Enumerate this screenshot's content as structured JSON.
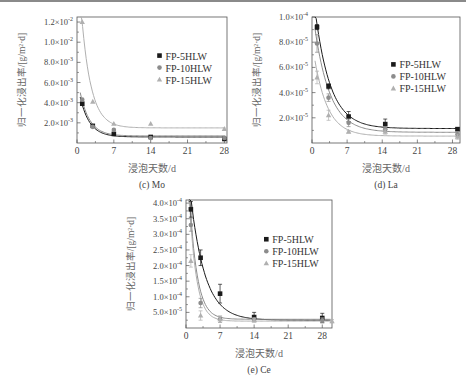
{
  "chart_data": [
    {
      "id": "mo",
      "type": "scatter",
      "caption": "(c) Mo",
      "title": "",
      "xlabel": "浸泡天数/d",
      "ylabel": "归一化浸出率/[g/m²·d]",
      "xlim": [
        0,
        28.5
      ],
      "ylim": [
        0,
        0.0125
      ],
      "xticks": [
        0,
        7,
        14,
        21,
        28
      ],
      "yticks": [
        0.002,
        0.004,
        0.006,
        0.008,
        0.01,
        0.012
      ],
      "ytick_labels": [
        {
          "m": "2.0",
          "e": "-3"
        },
        {
          "m": "4.0",
          "e": "-3"
        },
        {
          "m": "6.0",
          "e": "-3"
        },
        {
          "m": "8.0",
          "e": "-3"
        },
        {
          "m": "1.0",
          "e": "-2"
        },
        {
          "m": "1.2",
          "e": "-2"
        }
      ],
      "grid": false,
      "legend_position": "upper right (inside)",
      "series": [
        {
          "name": "FP-5HLW",
          "marker": "square",
          "color": "#1a1a1a",
          "x": [
            1,
            3,
            7,
            14,
            28
          ],
          "y": [
            0.0039,
            0.0017,
            0.0009,
            0.0006,
            0.0004
          ],
          "fit": {
            "a": 0.0055,
            "k": 0.55,
            "c": 0.0006
          }
        },
        {
          "name": "FP-10HLW",
          "marker": "circle",
          "color": "#8c8c8c",
          "x": [
            1,
            3,
            7,
            14,
            28
          ],
          "y": [
            0.0043,
            0.0016,
            0.0013,
            0.0005,
            0.0005
          ],
          "fit": {
            "a": 0.006,
            "k": 0.55,
            "c": 0.0007
          }
        },
        {
          "name": "FP-15HLW",
          "marker": "triangle",
          "color": "#b0b0b0",
          "x": [
            1,
            3,
            7,
            14,
            28
          ],
          "y": [
            0.012,
            0.0041,
            0.0019,
            0.0019,
            0.0014
          ],
          "fit": {
            "a": 0.018,
            "k": 0.55,
            "c": 0.0015
          }
        }
      ]
    },
    {
      "id": "la",
      "type": "scatter",
      "caption": "(d) La",
      "title": "",
      "xlabel": "浸泡天数/d",
      "ylabel": "归一化浸出率/[g/m²·d]",
      "xlim": [
        0,
        29.5
      ],
      "ylim": [
        0,
        0.0001
      ],
      "xticks": [
        0,
        7,
        14,
        21,
        28
      ],
      "yticks": [
        2e-05,
        4e-05,
        6e-05,
        8e-05,
        0.0001
      ],
      "ytick_labels": [
        {
          "m": "2.0",
          "e": "-5"
        },
        {
          "m": "4.0",
          "e": "-5"
        },
        {
          "m": "6.0",
          "e": "-5"
        },
        {
          "m": "8.0",
          "e": "-5"
        },
        {
          "m": "1.0",
          "e": "-4"
        }
      ],
      "grid": false,
      "legend_position": "center right (inside)",
      "series": [
        {
          "name": "FP-5HLW",
          "marker": "square",
          "color": "#1a1a1a",
          "x": [
            1,
            3.3,
            7.3,
            14.6,
            29
          ],
          "y": [
            9.2e-05,
            4.5e-05,
            2.1e-05,
            1.5e-05,
            1.1e-05
          ],
          "err": [
            2e-06,
            2e-06,
            4e-06,
            4e-06,
            1e-06
          ],
          "fit": {
            "a": 0.000115,
            "k": 0.33,
            "c": 1.15e-05
          }
        },
        {
          "name": "FP-10HLW",
          "marker": "circle",
          "color": "#8c8c8c",
          "x": [
            1,
            3.3,
            7.3,
            14.6,
            29
          ],
          "y": [
            7.9e-05,
            3.6e-05,
            1.6e-05,
            1.1e-05,
            7e-06
          ],
          "err": [
            7e-06,
            3e-06,
            3e-06,
            2e-06,
            2e-06
          ],
          "fit": {
            "a": 0.0001,
            "k": 0.33,
            "c": 8.5e-06
          }
        },
        {
          "name": "FP-15HLW",
          "marker": "triangle",
          "color": "#b0b0b0",
          "x": [
            1,
            3.3,
            7.3,
            14.6,
            29
          ],
          "y": [
            5.2e-05,
            2.2e-05,
            9e-06,
            9e-06,
            5e-06
          ],
          "err": [
            5e-06,
            4e-06,
            1e-06,
            2e-06,
            2e-06
          ],
          "fit": {
            "a": 7.5e-05,
            "k": 0.38,
            "c": 5.5e-06
          }
        }
      ]
    },
    {
      "id": "ce",
      "type": "scatter",
      "caption": "(e) Ce",
      "title": "",
      "xlabel": "浸泡天数/d",
      "ylabel": "归一化浸出率/[g/m²·d]",
      "xlim": [
        0,
        30
      ],
      "ylim": [
        0,
        0.00041
      ],
      "xticks": [
        0,
        7,
        14,
        21,
        28
      ],
      "yticks": [
        5e-05,
        0.0001,
        0.00015,
        0.0002,
        0.00025,
        0.0003,
        0.00035,
        0.0004
      ],
      "ytick_labels": [
        {
          "m": "5.0",
          "e": "-5"
        },
        {
          "m": "1.0",
          "e": "-4"
        },
        {
          "m": "1.5",
          "e": "-4"
        },
        {
          "m": "2.0",
          "e": "-4"
        },
        {
          "m": "2.5",
          "e": "-4"
        },
        {
          "m": "3.0",
          "e": "-4"
        },
        {
          "m": "3.5",
          "e": "-4"
        },
        {
          "m": "4.0",
          "e": "-4"
        }
      ],
      "grid": false,
      "legend_position": "upper right (inside)",
      "series": [
        {
          "name": "FP-5HLW",
          "marker": "square",
          "color": "#1a1a1a",
          "x": [
            1,
            3,
            7,
            14,
            28
          ],
          "y": [
            0.00038,
            0.000225,
            0.00011,
            3.5e-05,
            3.2e-05
          ],
          "err": [
            2.5e-05,
            2.5e-05,
            3e-05,
            1.5e-05,
            1.5e-05
          ],
          "fit": {
            "a": 0.00055,
            "k": 0.34,
            "c": 2.5e-05
          }
        },
        {
          "name": "FP-10HLW",
          "marker": "circle",
          "color": "#8c8c8c",
          "x": [
            1,
            3,
            7,
            14,
            28
          ],
          "y": [
            0.00033,
            8e-05,
            2.8e-05,
            2.8e-05,
            2.5e-05
          ],
          "err": [
            2e-05,
            1.5e-05,
            1e-05,
            5e-06,
            8e-06
          ],
          "fit": {
            "a": 0.00063,
            "k": 0.65,
            "c": 2.8e-05
          }
        },
        {
          "name": "FP-15HLW",
          "marker": "triangle",
          "color": "#b0b0b0",
          "x": [
            1,
            3,
            7,
            14,
            30
          ],
          "y": [
            0.000215,
            4e-05,
            2.8e-05,
            2.5e-05,
            2.2e-05
          ],
          "err": [
            2e-05,
            1.5e-05,
            1e-05,
            5e-06,
            5e-06
          ],
          "fit": {
            "a": 0.00063,
            "k": 0.7,
            "c": 2.2e-05
          }
        }
      ]
    }
  ],
  "panels_layout": [
    {
      "left": 0,
      "top": 0,
      "plot": {
        "x": 77,
        "y": 17,
        "w": 150,
        "h": 126
      }
    },
    {
      "left": 233,
      "top": 0,
      "plot": {
        "x": 312,
        "y": 17,
        "w": 148,
        "h": 126
      }
    },
    {
      "left": 110,
      "top": 185,
      "plot": {
        "x": 186,
        "y": 200,
        "w": 146,
        "h": 128
      }
    }
  ]
}
